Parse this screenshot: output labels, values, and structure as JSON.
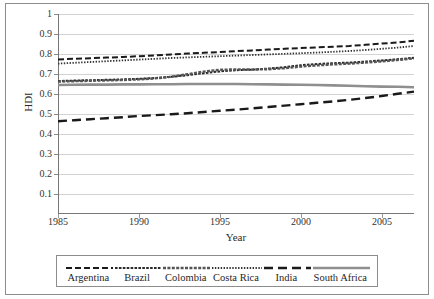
{
  "chart_data": {
    "type": "line",
    "title": "",
    "xlabel": "Year",
    "ylabel": "HDI",
    "xlim": [
      1985,
      2007
    ],
    "ylim": [
      0,
      1
    ],
    "grid": true,
    "legend_position": "bottom",
    "xticks": [
      "1985",
      "1990",
      "1995",
      "2000",
      "2005"
    ],
    "xtick_values": [
      1985,
      1990,
      1995,
      2000,
      2005
    ],
    "yticks": [
      "0.1",
      "0.2",
      "0.3",
      "0.4",
      "0.5",
      "0.6",
      "0.7",
      "0.8",
      "0.9",
      "1"
    ],
    "ytick_values": [
      0.1,
      0.2,
      0.3,
      0.4,
      0.5,
      0.6,
      0.7,
      0.8,
      0.9,
      1
    ],
    "x": [
      1985,
      1986,
      1987,
      1988,
      1989,
      1990,
      1991,
      1992,
      1993,
      1994,
      1995,
      1996,
      1997,
      1998,
      1999,
      2000,
      2001,
      2002,
      2003,
      2004,
      2005,
      2006,
      2007
    ],
    "series": [
      {
        "name": "Argentina",
        "dash": "dashed",
        "color": "#1a1a1a",
        "width": 2.0,
        "values": [
          0.773,
          0.776,
          0.779,
          0.782,
          0.785,
          0.789,
          0.793,
          0.798,
          0.802,
          0.806,
          0.81,
          0.814,
          0.818,
          0.822,
          0.826,
          0.83,
          0.833,
          0.836,
          0.84,
          0.846,
          0.852,
          0.858,
          0.866
        ]
      },
      {
        "name": "Brazil",
        "dash": "dash-dot-fine",
        "color": "#2a2a2a",
        "width": 2.0,
        "values": [
          0.665,
          0.667,
          0.669,
          0.671,
          0.673,
          0.676,
          0.68,
          0.686,
          0.694,
          0.704,
          0.713,
          0.719,
          0.722,
          0.727,
          0.734,
          0.744,
          0.75,
          0.754,
          0.757,
          0.762,
          0.768,
          0.774,
          0.781
        ]
      },
      {
        "name": "Colombia",
        "dash": "thick-dotted",
        "color": "#555555",
        "width": 2.4,
        "values": [
          0.662,
          0.664,
          0.666,
          0.668,
          0.67,
          0.673,
          0.678,
          0.686,
          0.699,
          0.712,
          0.721,
          0.723,
          0.722,
          0.724,
          0.729,
          0.737,
          0.743,
          0.748,
          0.752,
          0.757,
          0.763,
          0.77,
          0.778
        ]
      },
      {
        "name": "Costa Rica",
        "dash": "fine-dotted",
        "color": "#333333",
        "width": 1.8,
        "values": [
          0.752,
          0.756,
          0.76,
          0.764,
          0.768,
          0.772,
          0.776,
          0.78,
          0.783,
          0.786,
          0.789,
          0.792,
          0.795,
          0.798,
          0.801,
          0.804,
          0.807,
          0.811,
          0.815,
          0.82,
          0.826,
          0.832,
          0.84
        ]
      },
      {
        "name": "India",
        "dash": "long-dash",
        "color": "#1a1a1a",
        "width": 2.4,
        "values": [
          0.464,
          0.469,
          0.474,
          0.479,
          0.484,
          0.49,
          0.494,
          0.499,
          0.504,
          0.51,
          0.516,
          0.522,
          0.528,
          0.535,
          0.542,
          0.549,
          0.556,
          0.563,
          0.571,
          0.58,
          0.59,
          0.601,
          0.612
        ]
      },
      {
        "name": "South Africa",
        "dash": "solid",
        "color": "#8f8f8f",
        "width": 2.6,
        "values": [
          0.645,
          0.646,
          0.647,
          0.647,
          0.648,
          0.648,
          0.649,
          0.649,
          0.65,
          0.65,
          0.65,
          0.65,
          0.649,
          0.648,
          0.647,
          0.646,
          0.645,
          0.643,
          0.641,
          0.639,
          0.637,
          0.636,
          0.634
        ]
      }
    ]
  },
  "axes": {
    "x_title": "Year",
    "y_title": "HDI"
  },
  "legend": {
    "items": [
      {
        "label": "Argentina"
      },
      {
        "label": "Brazil"
      },
      {
        "label": "Colombia"
      },
      {
        "label": "Costa Rica"
      },
      {
        "label": "India"
      },
      {
        "label": "South Africa"
      }
    ]
  }
}
